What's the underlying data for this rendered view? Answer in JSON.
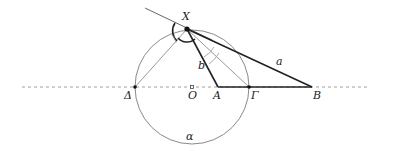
{
  "diagram": {
    "type": "geometry",
    "points": {
      "X": {
        "label": "X",
        "x": 187,
        "y": 29
      },
      "Delta": {
        "label": "Δ",
        "x": 135,
        "y": 87
      },
      "O": {
        "label": "O",
        "x": 192,
        "y": 87
      },
      "A": {
        "label": "A",
        "x": 218,
        "y": 87
      },
      "Gamma": {
        "label": "Γ",
        "x": 249,
        "y": 87
      },
      "B": {
        "label": "B",
        "x": 312,
        "y": 87
      }
    },
    "segments": {
      "a": {
        "label": "a",
        "from": "X",
        "to": "B"
      },
      "b": {
        "label": "b",
        "from": "X",
        "to": "A"
      }
    },
    "circle": {
      "label": "α",
      "center": "O",
      "radius": 57
    },
    "colors": {
      "bold_line": "#222222",
      "thin_line": "#888888",
      "dashed_line": "#999999",
      "circle": "#888888"
    }
  }
}
